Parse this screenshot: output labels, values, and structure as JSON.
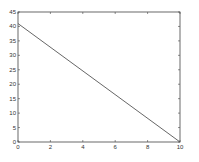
{
  "chart_data": {
    "type": "line",
    "title": "",
    "xlabel": "",
    "ylabel": "",
    "xlim": [
      0,
      10
    ],
    "ylim": [
      0,
      45
    ],
    "xticks": [
      "0",
      "2",
      "4",
      "6",
      "8",
      "10"
    ],
    "yticks": [
      "0",
      "5",
      "10",
      "15",
      "20",
      "25",
      "30",
      "35",
      "40",
      "45"
    ],
    "grid": false,
    "legend": null,
    "series": [
      {
        "name": "line",
        "x": [
          0,
          10
        ],
        "y": [
          41,
          0
        ],
        "color": "#555555"
      }
    ]
  }
}
